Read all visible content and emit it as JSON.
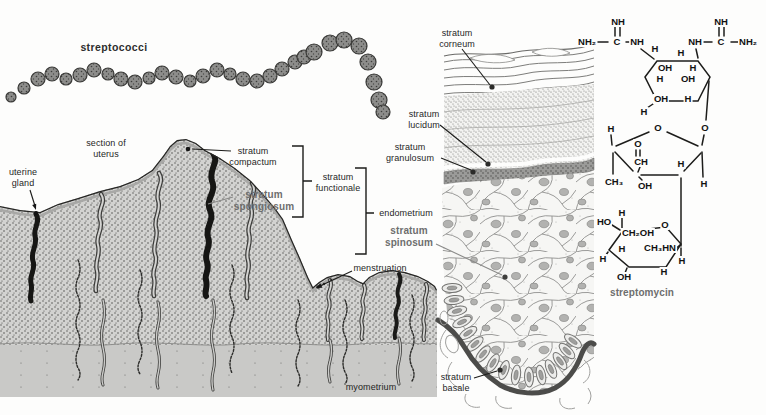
{
  "palette": {
    "ink": "#1c1c1c",
    "label_gray": "#6e6e6e",
    "panel_gray": "#c9c9c7"
  },
  "labels": {
    "streptococci": "streptococci",
    "section_uterus": "section of\nuterus",
    "uterine_gland": "uterine\ngland",
    "stratum_compactum": "stratum\ncompactum",
    "stratum_spongiosum": "stratum\nspongiosum",
    "stratum_functionale": "stratum\nfunctionale",
    "endometrium": "endometrium",
    "menstruation": "menstruation",
    "myometrium": "myometrium",
    "stratum_corneum": "stratum\ncorneum",
    "stratum_lucidum": "stratum\nlucidum",
    "stratum_granulosum": "stratum\ngranulosum",
    "stratum_spinosum": "stratum\nspinosum",
    "stratum_basale": "stratum\nbasale",
    "streptomycin": "streptomycin"
  },
  "chemistry": {
    "compound": "streptomycin",
    "atoms": [
      {
        "t": "NH",
        "x": 618,
        "y": 22
      },
      {
        "t": "NH₂",
        "x": 587,
        "y": 42
      },
      {
        "t": "C",
        "x": 617,
        "y": 42
      },
      {
        "t": "NH",
        "x": 637,
        "y": 42
      },
      {
        "t": "NH",
        "x": 721,
        "y": 22
      },
      {
        "t": "NH",
        "x": 695,
        "y": 42
      },
      {
        "t": "C",
        "x": 721,
        "y": 42
      },
      {
        "t": "NH₂",
        "x": 748,
        "y": 42
      },
      {
        "t": "H",
        "x": 655,
        "y": 49
      },
      {
        "t": "H",
        "x": 681,
        "y": 53
      },
      {
        "t": "OH",
        "x": 665,
        "y": 68
      },
      {
        "t": "H",
        "x": 693,
        "y": 68
      },
      {
        "t": "H",
        "x": 660,
        "y": 79
      },
      {
        "t": "OH",
        "x": 688,
        "y": 79
      },
      {
        "t": "OH",
        "x": 661,
        "y": 99
      },
      {
        "t": "H",
        "x": 688,
        "y": 99
      },
      {
        "t": "H",
        "x": 644,
        "y": 112
      },
      {
        "t": "H",
        "x": 611,
        "y": 129
      },
      {
        "t": "O",
        "x": 658,
        "y": 128
      },
      {
        "t": "O",
        "x": 705,
        "y": 128
      },
      {
        "t": "O",
        "x": 638,
        "y": 144
      },
      {
        "t": "CH",
        "x": 641,
        "y": 162
      },
      {
        "t": "H",
        "x": 681,
        "y": 164
      },
      {
        "t": "CH₃",
        "x": 614,
        "y": 182
      },
      {
        "t": "OH",
        "x": 645,
        "y": 186
      },
      {
        "t": "H",
        "x": 704,
        "y": 184
      },
      {
        "t": "H",
        "x": 622,
        "y": 213
      },
      {
        "t": "HO",
        "x": 604,
        "y": 222
      },
      {
        "t": "O",
        "x": 665,
        "y": 225
      },
      {
        "t": "CH₂OH",
        "x": 638,
        "y": 233
      },
      {
        "t": "H",
        "x": 622,
        "y": 249
      },
      {
        "t": "CH₃HN",
        "x": 660,
        "y": 248
      },
      {
        "t": "H",
        "x": 682,
        "y": 261
      },
      {
        "t": "H",
        "x": 664,
        "y": 272
      },
      {
        "t": "OH",
        "x": 624,
        "y": 277
      },
      {
        "t": "H",
        "x": 603,
        "y": 259
      }
    ]
  }
}
